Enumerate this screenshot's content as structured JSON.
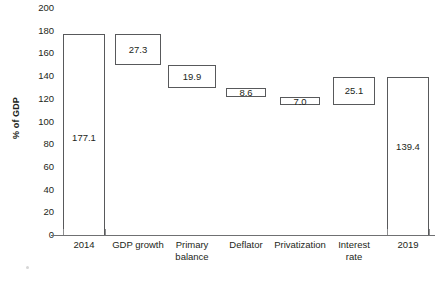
{
  "chart_data": {
    "type": "bar",
    "subtype": "waterfall",
    "title": "",
    "xlabel": "",
    "ylabel": "% of GDP",
    "ylim": [
      0,
      200
    ],
    "ytick_step": 20,
    "yticks": [
      200,
      180,
      160,
      140,
      120,
      100,
      80,
      60,
      40,
      20,
      0
    ],
    "ytick_labels": [
      "200",
      "180",
      "160",
      "140",
      "120",
      "100",
      "80",
      "60",
      "40",
      "20",
      "0"
    ],
    "grid": false,
    "legend": false,
    "categories": [
      "2014",
      "GDP growth",
      "Primary\nbalance",
      "Deflator",
      "Privatization",
      "Interest\nrate",
      "2019"
    ],
    "values": [
      177.1,
      27.3,
      19.9,
      8.6,
      7.0,
      25.1,
      139.4
    ],
    "value_labels": [
      "177.1",
      "27.3",
      "19.9",
      "8.6",
      "7.0",
      "25.1",
      "139.4"
    ],
    "bars": [
      {
        "category": "2014",
        "label": "2014",
        "value": 177.1,
        "value_label": "177.1",
        "kind": "total",
        "base": 0.0,
        "top": 177.1,
        "label_inside": true,
        "label_position": "inside-lower"
      },
      {
        "category": "GDP growth",
        "label": "GDP growth",
        "value": 27.3,
        "value_label": "27.3",
        "kind": "decrease",
        "base": 149.8,
        "top": 177.1,
        "label_inside": true,
        "label_position": "center"
      },
      {
        "category": "Primary balance",
        "label": "Primary\nbalance",
        "value": 19.9,
        "value_label": "19.9",
        "kind": "decrease",
        "base": 129.9,
        "top": 149.8,
        "label_inside": true,
        "label_position": "center"
      },
      {
        "category": "Deflator",
        "label": "Deflator",
        "value": 8.6,
        "value_label": "8.6",
        "kind": "decrease",
        "base": 121.3,
        "top": 129.9,
        "label_inside": true,
        "label_position": "center"
      },
      {
        "category": "Privatization",
        "label": "Privatization",
        "value": 7.0,
        "value_label": "7.0",
        "kind": "decrease",
        "base": 114.3,
        "top": 121.3,
        "label_inside": true,
        "label_position": "center"
      },
      {
        "category": "Interest rate",
        "label": "Interest\nrate",
        "value": 25.1,
        "value_label": "25.1",
        "kind": "increase",
        "base": 114.3,
        "top": 139.4,
        "label_inside": true,
        "label_position": "center"
      },
      {
        "category": "2019",
        "label": "2019",
        "value": 139.4,
        "value_label": "139.4",
        "kind": "total",
        "base": 0.0,
        "top": 139.4,
        "label_inside": true,
        "label_position": "inside-upper"
      }
    ],
    "colors": {
      "bar_fill": "#ffffff",
      "bar_stroke": "#58595b",
      "axis": "#6f7072",
      "text": "#231f20",
      "background": "#ffffff"
    }
  }
}
